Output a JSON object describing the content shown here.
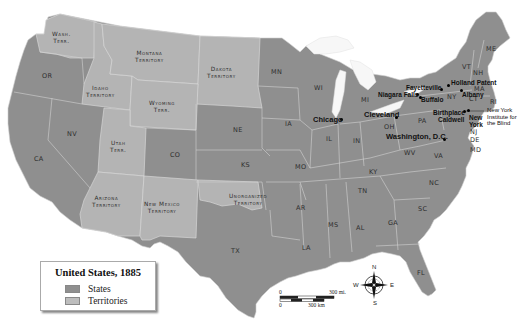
{
  "map": {
    "title": "United States, 1885",
    "colors": {
      "states": "#8f8f8f",
      "territories": "#b4b4b4",
      "borders": "#d4d4d4",
      "water": "#ffffff",
      "lakes": "#f4f4f4"
    },
    "legend": {
      "title": "United States, 1885",
      "items": [
        {
          "label": "States",
          "color": "#8f8f8f"
        },
        {
          "label": "Territories",
          "color": "#bdbdbd"
        }
      ]
    },
    "territories": [
      {
        "id": "wash",
        "line1": "Wash.",
        "line2": "Terr."
      },
      {
        "id": "montana",
        "line1": "Montana",
        "line2": "Territory"
      },
      {
        "id": "dakota",
        "line1": "Dakota",
        "line2": "Territory"
      },
      {
        "id": "idaho",
        "line1": "Idaho",
        "line2": "Territory"
      },
      {
        "id": "wyoming",
        "line1": "Wyoming",
        "line2": "Terr."
      },
      {
        "id": "utah",
        "line1": "Utah",
        "line2": "Terr."
      },
      {
        "id": "arizona",
        "line1": "Arizona",
        "line2": "Territory"
      },
      {
        "id": "newmexico",
        "line1": "New Mexico",
        "line2": "Territory"
      },
      {
        "id": "unorganized",
        "line1": "Unorganized",
        "line2": "Territory"
      }
    ],
    "states": {
      "OR": "OR",
      "CA": "CA",
      "NV": "NV",
      "CO": "CO",
      "NE": "NE",
      "KS": "KS",
      "TX": "TX",
      "MN": "MN",
      "IA": "IA",
      "MO": "MO",
      "AR": "AR",
      "LA": "LA",
      "WI": "WI",
      "IL": "IL",
      "MI": "MI",
      "IN": "IN",
      "OH": "OH",
      "KY": "KY",
      "TN": "TN",
      "MS": "MS",
      "AL": "AL",
      "GA": "GA",
      "FL": "FL",
      "SC": "SC",
      "NC": "NC",
      "VA": "VA",
      "WV": "WV",
      "PA": "PA",
      "NY": "NY",
      "VT": "VT",
      "NH": "NH",
      "ME": "ME",
      "MA": "MA",
      "CT": "CT",
      "RI": "RI",
      "NJ": "NJ",
      "DE": "DE",
      "MD": "MD"
    },
    "cities": {
      "chicago": "Chicago",
      "cleveland": "Cleveland",
      "washington": "Washington, D.C.",
      "niagara": "Niagara Falls",
      "buffalo": "Buffalo",
      "fayetteville": "Fayetteville",
      "holland_patent": "Holland Patent",
      "albany": "Albany",
      "birthplace": "Birthplace",
      "caldwell": "Caldwell",
      "new_york_1": "New",
      "new_york_2": "York"
    },
    "annotations": {
      "nyib_1": "New York",
      "nyib_2": "Institute for",
      "nyib_3": "the Blind"
    },
    "scale_bar": {
      "mi_start": "0",
      "mi_end": "300 mi.",
      "km_start": "0",
      "km_end": "300 km"
    },
    "compass": {
      "n": "N",
      "s": "S",
      "e": "E",
      "w": "W"
    }
  }
}
